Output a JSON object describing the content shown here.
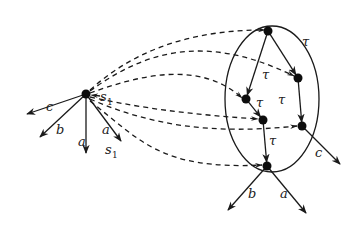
{
  "diagram": {
    "colors": {
      "ink": "#1a1a1a",
      "background": "#ffffff"
    },
    "left_node": {
      "position": [
        86,
        94
      ],
      "edges": [
        {
          "label": "c",
          "to": [
            27,
            114
          ],
          "label_pos": [
            46,
            111
          ]
        },
        {
          "label": "b",
          "to": [
            40,
            137
          ],
          "label_pos": [
            56,
            134
          ]
        },
        {
          "label": "a",
          "to": [
            86,
            153
          ],
          "label_pos": [
            78,
            146
          ]
        },
        {
          "label": "a",
          "to": [
            121,
            141
          ],
          "label_pos": [
            102,
            134
          ]
        }
      ],
      "self_label": {
        "text": "s",
        "sub": "1",
        "pos": [
          100,
          101
        ]
      },
      "lower_label": {
        "text": "s",
        "sub": "1",
        "pos": [
          105,
          154
        ]
      }
    },
    "ellipse": {
      "cx": 272,
      "cy": 99,
      "rx": 47,
      "ry": 73
    },
    "cluster_nodes": [
      {
        "id": "top",
        "position": [
          268,
          31
        ]
      },
      {
        "id": "right_upper",
        "position": [
          298,
          78
        ]
      },
      {
        "id": "left_mid",
        "position": [
          246,
          99
        ]
      },
      {
        "id": "center",
        "position": [
          263,
          120
        ]
      },
      {
        "id": "right_lower",
        "position": [
          302,
          126
        ]
      },
      {
        "id": "bottom",
        "position": [
          267,
          166
        ]
      }
    ],
    "tau_edges": [
      {
        "from": "top",
        "to": "right_upper",
        "label": "τ",
        "label_pos": [
          302,
          46
        ]
      },
      {
        "from": "top",
        "to": "left_mid",
        "label": "",
        "label_pos": null
      },
      {
        "from": "left_mid",
        "to": "center",
        "label": "τ",
        "label_pos": [
          256,
          107
        ]
      },
      {
        "from": "right_upper",
        "to": "right_lower",
        "label": "τ",
        "label_pos": [
          278,
          104
        ]
      },
      {
        "from": "center",
        "to": "bottom",
        "label": "τ",
        "label_pos": [
          269,
          145
        ]
      }
    ],
    "mid_tau_label": {
      "text": "τ",
      "pos": [
        262,
        79
      ]
    },
    "cluster_out_edges": [
      {
        "from": "right_lower",
        "label": "c",
        "to": [
          340,
          164
        ],
        "label_pos": [
          315,
          157
        ]
      },
      {
        "from": "bottom",
        "label": "b",
        "to": [
          228,
          210
        ],
        "label_pos": [
          248,
          198
        ]
      },
      {
        "from": "bottom",
        "label": "a",
        "to": [
          306,
          213
        ],
        "label_pos": [
          280,
          198
        ]
      }
    ],
    "dashed_arrows": [
      {
        "to": "top",
        "path": "M90,90 C140,45 200,30 265,30"
      },
      {
        "to": "right_upper",
        "path": "M90,91 C140,55 200,30 294,76"
      },
      {
        "to": "left_mid",
        "path": "M90,93 C140,75 200,60 242,98"
      },
      {
        "to": "center",
        "path": "M90,97 C150,110 200,115 258,119"
      },
      {
        "to": "right_lower",
        "path": "M90,99 C150,125 210,135 297,126"
      },
      {
        "to": "bottom",
        "path": "M90,101 C140,140 160,170 262,165"
      }
    ]
  }
}
